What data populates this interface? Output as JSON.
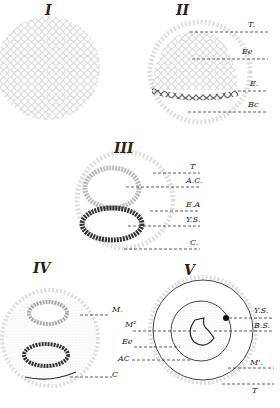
{
  "panels": [
    {
      "id": "I",
      "title": "I",
      "labels": []
    },
    {
      "id": "II",
      "title": "II",
      "labels": [
        "T.",
        "Ee",
        "E.",
        "Bc"
      ]
    },
    {
      "id": "III",
      "title": "III",
      "labels": [
        "T",
        "A.C.",
        "E.A",
        "Y.S.",
        "C."
      ]
    },
    {
      "id": "IV",
      "title": "IV",
      "labels": [
        "M.",
        "C"
      ]
    },
    {
      "id": "V",
      "title": "V",
      "labels": [
        "M²",
        "Ee",
        "AC",
        "Y.S.",
        "B.S.",
        "M'.",
        "T"
      ]
    }
  ],
  "colors": {
    "cells": "#c8c8c8",
    "dark_cells": "#333333",
    "ink": "#222222"
  }
}
